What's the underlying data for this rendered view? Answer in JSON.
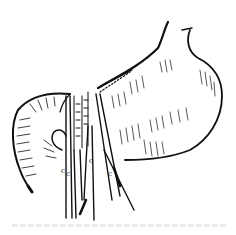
{
  "figure": {
    "style": "black ink line drawing on white",
    "colors": {
      "ink": "#111111",
      "background": "#ffffff",
      "caption_faint": "#e6e6e6"
    },
    "elements": [
      "stomach",
      "esophagus-stump",
      "duodenum-loop",
      "suture-line",
      "surgical-clamps"
    ],
    "clamp_labels": [
      "c",
      "c",
      "c",
      "c"
    ],
    "caption": ""
  }
}
